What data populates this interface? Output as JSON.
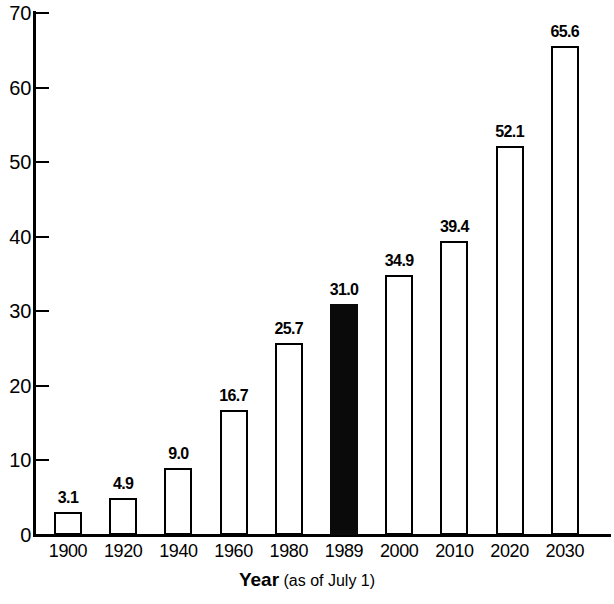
{
  "chart_data": {
    "type": "bar",
    "title": "",
    "subtitle": "",
    "xlabel_bold": "Year",
    "xlabel_note": "(as of July 1)",
    "ylabel": "",
    "ylim": [
      0,
      70
    ],
    "yticks": [
      0,
      10,
      20,
      30,
      40,
      50,
      60,
      70
    ],
    "ytick_labels": [
      "0",
      "10",
      "20",
      "30",
      "40",
      "50",
      "60",
      "70"
    ],
    "grid": false,
    "legend": null,
    "categories": [
      "1900",
      "1920",
      "1940",
      "1960",
      "1980",
      "1989",
      "2000",
      "2010",
      "2020",
      "2030"
    ],
    "values": [
      3.1,
      4.9,
      9.0,
      16.7,
      25.7,
      31.0,
      34.9,
      39.4,
      52.1,
      65.6
    ],
    "value_labels": [
      "3.1",
      "4.9",
      "9.0",
      "16.7",
      "25.7",
      "31.0",
      "34.9",
      "39.4",
      "52.1",
      "65.6"
    ],
    "bar_styles": [
      "outline",
      "outline",
      "outline",
      "outline",
      "outline",
      "filled",
      "outline",
      "outline",
      "outline",
      "outline"
    ],
    "highlight_category": "1989",
    "colors": {
      "bar_outline": "#000000",
      "bar_fill": "#ffffff",
      "bar_highlight_fill": "#0a0a0a",
      "axis": "#000000",
      "text": "#000000",
      "background": "#ffffff"
    }
  }
}
